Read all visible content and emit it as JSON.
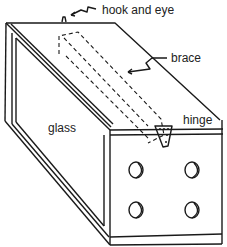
{
  "diagram": {
    "labels": {
      "hook_and_eye": "hook and eye",
      "brace": "brace",
      "hinge": "hinge",
      "glass": "glass"
    },
    "holes_count": 4
  }
}
